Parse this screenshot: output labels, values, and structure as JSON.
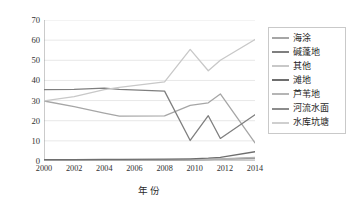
{
  "chart_data": {
    "type": "line",
    "title": "",
    "xlabel": "年份",
    "ylabel": "PLAND/%",
    "x": [
      2000,
      2002,
      2004,
      2005,
      2008,
      2009.7,
      2010.9,
      2011.7,
      2014
    ],
    "xlim": [
      2000,
      2014
    ],
    "ylim": [
      0,
      70
    ],
    "yticks": [
      0,
      10,
      20,
      30,
      40,
      50,
      60,
      70
    ],
    "xticks": [
      2000,
      2002,
      2004,
      2006,
      2008,
      2010,
      2012,
      2014
    ],
    "grid": "horizontal",
    "legend_position": "right",
    "series": [
      {
        "name": "海涂",
        "color": "#a6a6a6",
        "points": [
          [
            2000,
            29.8
          ],
          [
            2002,
            27.0
          ],
          [
            2004,
            23.8
          ],
          [
            2005,
            22.3
          ],
          [
            2008,
            22.4
          ],
          [
            2009.7,
            27.6
          ],
          [
            2010.9,
            28.9
          ],
          [
            2011.7,
            33.3
          ],
          [
            2014,
            9.0
          ]
        ]
      },
      {
        "name": "碱蓬地",
        "color": "#7f7f7f",
        "points": [
          [
            2000,
            35.4
          ],
          [
            2002,
            35.6
          ],
          [
            2004,
            36.2
          ],
          [
            2005,
            35.6
          ],
          [
            2008,
            34.7
          ],
          [
            2009.7,
            10.2
          ],
          [
            2010.9,
            22.5
          ],
          [
            2011.7,
            11.2
          ],
          [
            2014,
            23.0
          ]
        ]
      },
      {
        "name": "其他",
        "color": "#c8c8c8",
        "points": [
          [
            2000,
            29.8
          ],
          [
            2002,
            32.0
          ],
          [
            2004,
            35.4
          ],
          [
            2005,
            36.6
          ],
          [
            2008,
            39.3
          ],
          [
            2009.7,
            55.4
          ],
          [
            2010.9,
            44.8
          ],
          [
            2011.7,
            50.0
          ],
          [
            2014,
            60.3
          ]
        ]
      },
      {
        "name": "滩地",
        "color": "#6e6e6e",
        "points": [
          [
            2000,
            0.7
          ],
          [
            2002,
            0.7
          ],
          [
            2004,
            0.8
          ],
          [
            2005,
            0.8
          ],
          [
            2008,
            0.9
          ],
          [
            2009.7,
            1.1
          ],
          [
            2010.9,
            1.4
          ],
          [
            2011.7,
            1.8
          ],
          [
            2014,
            4.6
          ]
        ]
      },
      {
        "name": "芦苇地",
        "color": "#b5b5b5",
        "points": [
          [
            2000,
            0.6
          ],
          [
            2002,
            0.6
          ],
          [
            2004,
            0.6
          ],
          [
            2005,
            0.6
          ],
          [
            2008,
            0.6
          ],
          [
            2009.7,
            0.7
          ],
          [
            2010.9,
            0.8
          ],
          [
            2011.7,
            1.0
          ],
          [
            2014,
            1.8
          ]
        ]
      },
      {
        "name": "河流水面",
        "color": "#8c8c8c",
        "points": [
          [
            2000,
            0.5
          ],
          [
            2002,
            0.5
          ],
          [
            2004,
            0.5
          ],
          [
            2005,
            0.5
          ],
          [
            2008,
            0.5
          ],
          [
            2009.7,
            0.6
          ],
          [
            2010.9,
            0.7
          ],
          [
            2011.7,
            0.9
          ],
          [
            2014,
            1.5
          ]
        ]
      },
      {
        "name": "水库坑塘",
        "color": "#cfcfcf",
        "points": [
          [
            2000,
            0.4
          ],
          [
            2002,
            0.4
          ],
          [
            2004,
            0.4
          ],
          [
            2005,
            0.4
          ],
          [
            2008,
            0.4
          ],
          [
            2009.7,
            0.5
          ],
          [
            2010.9,
            0.5
          ],
          [
            2011.7,
            0.6
          ],
          [
            2014,
            1.0
          ]
        ]
      }
    ]
  }
}
